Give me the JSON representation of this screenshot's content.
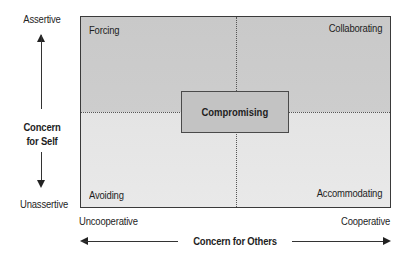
{
  "diagram": {
    "quadrants": {
      "top_left": "Forcing",
      "top_right": "Collaborating",
      "bottom_left": "Avoiding",
      "bottom_right": "Accommodating",
      "center": "Compromising"
    },
    "y_axis": {
      "title_line1": "Concern",
      "title_line2": "for Self",
      "top_label": "Assertive",
      "bottom_label": "Unassertive"
    },
    "x_axis": {
      "title": "Concern for Others",
      "left_label": "Uncooperative",
      "right_label": "Cooperative"
    },
    "colors": {
      "upper_fill": "#c9c9c9",
      "lower_fill": "#e6e6e6",
      "center_fill": "#c3c3c3",
      "border": "#3a3a3a"
    }
  }
}
